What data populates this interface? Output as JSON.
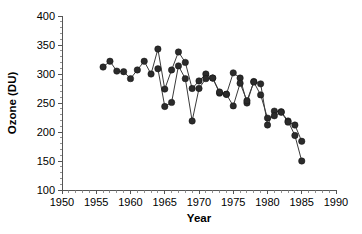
{
  "chart_data": {
    "type": "line",
    "title": "",
    "subtitle": "",
    "xlabel": "Year",
    "ylabel": "Ozone (DU)",
    "xlim": [
      1950,
      1990
    ],
    "ylim": [
      100,
      400
    ],
    "xticks": [
      1950,
      1955,
      1960,
      1965,
      1970,
      1975,
      1980,
      1985,
      1990
    ],
    "yticks": [
      100,
      150,
      200,
      250,
      300,
      350,
      400
    ],
    "xtick_labels": [
      "1950",
      "1955",
      "1960",
      "1965",
      "1970",
      "1975",
      "1980",
      "1985",
      "1990"
    ],
    "ytick_labels": [
      "100",
      "150",
      "200",
      "250",
      "300",
      "350",
      "400"
    ],
    "x_minor_tick_step": 1,
    "y_minor_tick_step": 10,
    "grid": false,
    "legend": null,
    "legend_position": "none",
    "annotations": [],
    "marker": "filled-circle",
    "marker_size": 3.2,
    "line_color": "#3a3a3a",
    "marker_color": "#2b2b2b",
    "frame_color": "#555555",
    "background_color": "#ffffff",
    "series": [
      {
        "name": "Total column ozone",
        "x": [
          1956,
          1957,
          1958,
          1959,
          1960,
          1961,
          1962,
          1963,
          1964,
          1965,
          1966,
          1967,
          1968,
          1969,
          1970,
          1971,
          1972,
          1973,
          1974,
          1975,
          1976,
          1977,
          1978,
          1979,
          1980,
          1981,
          1982,
          1983,
          1984,
          1985
        ],
        "values": [
          312,
          322,
          305,
          304,
          292,
          307,
          322,
          300,
          343,
          274,
          307,
          338,
          320,
          275,
          288,
          300,
          293,
          267,
          265,
          302,
          293,
          250,
          287,
          283,
          212,
          236,
          235,
          219,
          194,
          150
        ]
      },
      {
        "name": "Total column ozone (second trace)",
        "x": [
          1964,
          1965,
          1966,
          1967,
          1968,
          1969,
          1970,
          1971,
          1972,
          1973,
          1974,
          1975,
          1976,
          1977,
          1978,
          1979,
          1980,
          1981,
          1982,
          1983,
          1984,
          1985
        ],
        "values": [
          309,
          244,
          251,
          314,
          292,
          219,
          275,
          292,
          293,
          269,
          265,
          245,
          284,
          254,
          286,
          264,
          224,
          228,
          234,
          217,
          212,
          184
        ]
      }
    ]
  },
  "axis": {
    "x_title": "Year",
    "y_title": "Ozone (DU)"
  }
}
